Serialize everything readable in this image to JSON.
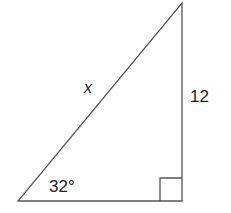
{
  "diagram": {
    "type": "right-triangle",
    "vertices": {
      "bottom_left": {
        "x": 18,
        "y": 201
      },
      "bottom_right": {
        "x": 182,
        "y": 201
      },
      "top": {
        "x": 182,
        "y": 3
      }
    },
    "labels": {
      "hypotenuse": "x",
      "vertical_side": "12",
      "angle": "32°"
    },
    "right_angle_marker": {
      "size": 22
    },
    "colors": {
      "stroke": "#555555",
      "text": "#222222",
      "background": "#ffffff"
    }
  }
}
